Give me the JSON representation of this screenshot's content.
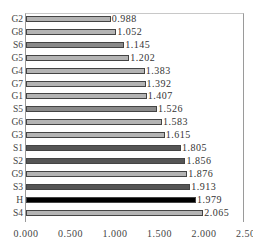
{
  "chart_data": {
    "type": "bar",
    "orientation": "horizontal",
    "title": "",
    "xlabel": "",
    "ylabel": "",
    "xlim": [
      0,
      2.5
    ],
    "grid": false,
    "legend": null,
    "categories": [
      "G2",
      "G8",
      "S6",
      "G5",
      "G4",
      "G7",
      "G1",
      "S5",
      "G6",
      "G3",
      "S1",
      "S2",
      "G9",
      "S3",
      "H",
      "S4"
    ],
    "values": [
      0.988,
      1.052,
      1.145,
      1.202,
      1.383,
      1.392,
      1.407,
      1.526,
      1.583,
      1.615,
      1.805,
      1.856,
      1.876,
      1.913,
      1.979,
      2.065
    ],
    "value_labels": [
      "0.988",
      "1.052",
      "1.145",
      "1.202",
      "1.383",
      "1.392",
      "1.407",
      "1.526",
      "1.583",
      "1.615",
      "1.805",
      "1.856",
      "1.876",
      "1.913",
      "1.979",
      "2.065"
    ],
    "bar_colors": [
      "#b4b4b4",
      "#b4b4b4",
      "#8a8a8a",
      "#b4b4b4",
      "#b4b4b4",
      "#b4b4b4",
      "#b4b4b4",
      "#8a8a8a",
      "#b4b4b4",
      "#b4b4b4",
      "#555555",
      "#555555",
      "#b4b4b4",
      "#555555",
      "#000000",
      "#b4b4b4"
    ],
    "x_ticks": [
      "0.000",
      "0.500",
      "1.000",
      "1.500",
      "2.000",
      "2.500"
    ]
  }
}
